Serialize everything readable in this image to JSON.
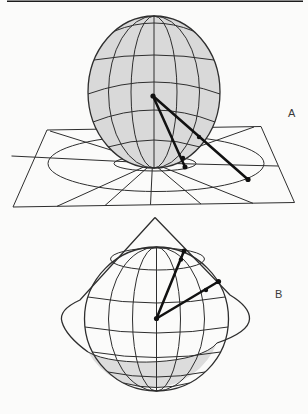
{
  "figure": {
    "label_a": "A",
    "label_b": "B"
  },
  "colors": {
    "background": "#fbfbfa",
    "line": "#2e2e2e",
    "ray": "#111111",
    "sphere_fill": "#d9d9d9",
    "shade_fill": "#dcdcdc",
    "label": "#3a3a3a",
    "scan_line": "#1c1c1c"
  }
}
